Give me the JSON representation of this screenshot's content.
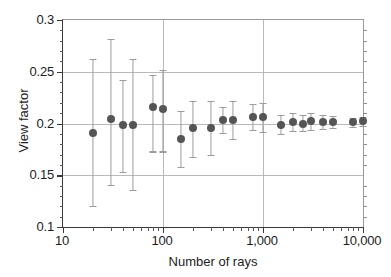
{
  "chart_data": {
    "type": "scatter",
    "title": "",
    "subtitle": "",
    "xlabel": "Number of rays",
    "ylabel": "View factor",
    "xscale": "log",
    "yscale": "linear",
    "xlim": [
      10,
      10000
    ],
    "ylim": [
      0.1,
      0.3
    ],
    "grid": true,
    "legend": null,
    "xticks": [
      10,
      100,
      1000,
      10000
    ],
    "xticklabels": [
      "10",
      "100",
      "1,000",
      "10,000"
    ],
    "yticks": [
      0.1,
      0.15,
      0.2,
      0.25,
      0.3
    ],
    "yticklabels": [
      "0.1",
      "0.15",
      "0.2",
      "0.25",
      "0.3"
    ],
    "marker_color": "#555555",
    "errorbar_color": "#9c9c9c",
    "series": [
      {
        "name": "View factor vs number of rays",
        "x": [
          20,
          30,
          40,
          50,
          80,
          100,
          150,
          200,
          300,
          400,
          500,
          800,
          1000,
          1500,
          2000,
          2500,
          3000,
          4000,
          5000,
          8000,
          10000
        ],
        "y": [
          0.191,
          0.204,
          0.199,
          0.199,
          0.216,
          0.214,
          0.185,
          0.196,
          0.196,
          0.203,
          0.203,
          0.206,
          0.206,
          0.199,
          0.201,
          0.2,
          0.202,
          0.201,
          0.201,
          0.201,
          0.202
        ],
        "yerr_low": [
          0.12,
          0.141,
          0.153,
          0.136,
          0.173,
          0.173,
          0.158,
          0.168,
          0.17,
          0.191,
          0.185,
          0.194,
          0.192,
          0.19,
          0.193,
          0.193,
          0.194,
          0.195,
          0.196,
          0.197,
          0.198
        ],
        "yerr_high": [
          0.262,
          0.282,
          0.242,
          0.262,
          0.247,
          0.252,
          0.212,
          0.222,
          0.222,
          0.216,
          0.222,
          0.219,
          0.22,
          0.208,
          0.21,
          0.208,
          0.21,
          0.208,
          0.207,
          0.205,
          0.206
        ]
      }
    ]
  },
  "axes": {
    "x_title": "Number of rays",
    "y_title": "View factor"
  }
}
